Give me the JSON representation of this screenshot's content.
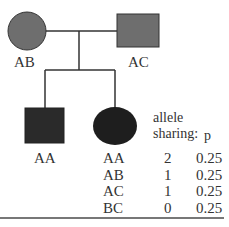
{
  "pedigree": {
    "parents": [
      {
        "sex": "female",
        "genotype": "AB",
        "fill": "#6e6e6e"
      },
      {
        "sex": "male",
        "genotype": "AC",
        "fill": "#6e6e6e"
      }
    ],
    "children": [
      {
        "sex": "male",
        "genotype": "AA",
        "fill": "#2a2a2a"
      },
      {
        "sex": "female",
        "genotype": "",
        "fill": "#1e1e1e"
      }
    ]
  },
  "table": {
    "header_line1": "allele",
    "header_line2": "sharing:",
    "header_p": "p",
    "rows": [
      {
        "genotype": "AA",
        "sharing": "2",
        "p": "0.25"
      },
      {
        "genotype": "AB",
        "sharing": "1",
        "p": "0.25"
      },
      {
        "genotype": "AC",
        "sharing": "1",
        "p": "0.25"
      },
      {
        "genotype": "BC",
        "sharing": "0",
        "p": "0.25"
      }
    ]
  }
}
